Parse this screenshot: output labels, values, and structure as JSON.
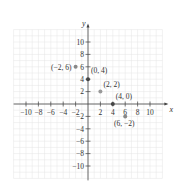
{
  "chart_data": {
    "type": "scatter",
    "title": "",
    "xlabel": "x",
    "ylabel": "y",
    "xlim": [
      -12,
      12
    ],
    "ylim": [
      -12,
      12
    ],
    "grid": true,
    "x_ticks": [
      -10,
      -8,
      -6,
      -4,
      -2,
      2,
      4,
      6,
      8,
      10
    ],
    "y_ticks": [
      -10,
      -8,
      -6,
      -4,
      -2,
      2,
      4,
      6,
      8,
      10
    ],
    "x_tick_labels": [
      "−10",
      "−8",
      "−6",
      "−4",
      "−2",
      "2",
      "4",
      "6",
      "8",
      "10"
    ],
    "y_tick_labels": [
      "−10",
      "−8",
      "−6",
      "−4",
      "−2",
      "2",
      "4",
      "6",
      "8",
      "10"
    ],
    "points": [
      {
        "x": -2,
        "y": 6,
        "label": "(−2, 6)",
        "color": "#888888"
      },
      {
        "x": 0,
        "y": 4,
        "label": "(0, 4)",
        "color": "#444444"
      },
      {
        "x": 2,
        "y": 2,
        "label": "(2, 2)",
        "color": "#999999"
      },
      {
        "x": 4,
        "y": 0,
        "label": "(4, 0)",
        "color": "#444444"
      },
      {
        "x": 6,
        "y": -2,
        "label": "(6, −2)",
        "color": "#888888"
      }
    ],
    "colors": {
      "axis": "#444444",
      "grid": "#e4e4e4"
    }
  }
}
